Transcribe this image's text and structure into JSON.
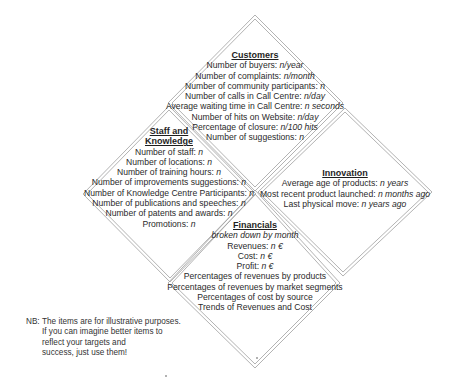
{
  "diagram": {
    "customers": {
      "title": "Customers",
      "items": [
        {
          "label": "Number of buyers: ",
          "value": "n/year"
        },
        {
          "label": "Number of complaints: ",
          "value": "n/month"
        },
        {
          "label": "Number of community participants: ",
          "value": "n"
        },
        {
          "label": "Number of calls in Call Centre: ",
          "value": "n/day"
        },
        {
          "label": "Average waiting time in Call Centre: ",
          "value": "n seconds"
        },
        {
          "label": "Number of hits on Website: ",
          "value": "n/day"
        },
        {
          "label": "Percentage of closure: ",
          "value": "n/100 hits"
        },
        {
          "label": "Number of suggestions: ",
          "value": "n"
        }
      ]
    },
    "staff": {
      "title_line1": "Staff and",
      "title_line2": "Knowledge",
      "items": [
        {
          "label": "Number of staff: ",
          "value": "n"
        },
        {
          "label": "Number of locations: ",
          "value": "n"
        },
        {
          "label": "Number of training hours: ",
          "value": "n"
        },
        {
          "label": "Number of improvements suggestions: ",
          "value": "n"
        },
        {
          "label": "Number of Knowledge Centre Participants: ",
          "value": "n"
        },
        {
          "label": "Number of publications and speeches: ",
          "value": "n"
        },
        {
          "label": "Number of patents and awards: ",
          "value": "n"
        },
        {
          "label": "Promotions: ",
          "value": "n"
        }
      ]
    },
    "innovation": {
      "title": "Innovation",
      "items": [
        {
          "label": "Average age of products: ",
          "value": "n years"
        },
        {
          "label": "Most recent product launched: ",
          "value": "n months ago"
        },
        {
          "label": "Last physical move: ",
          "value": "n years ago"
        }
      ]
    },
    "financials": {
      "title": "Financials",
      "subtitle": "broken down by month",
      "items": [
        {
          "label": "Revenues: ",
          "value": "n €"
        },
        {
          "label": "Cost: ",
          "value": "n €"
        },
        {
          "label": "Profit: ",
          "value": "n €"
        },
        {
          "label": "Percentages of revenues by products",
          "value": ""
        },
        {
          "label": "Percentages of revenues by market segments",
          "value": ""
        },
        {
          "label": "Percentages of cost by source",
          "value": ""
        },
        {
          "label": "Trends of Revenues and Cost",
          "value": ""
        }
      ]
    }
  },
  "note": {
    "label": "NB:",
    "lines": [
      "The items are for illustrative purposes.",
      "If you can imagine better items to",
      "reflect your targets and",
      "success, just use them!"
    ]
  },
  "colors": {
    "line": "#9a9a9a",
    "text": "#2a2a2a"
  }
}
